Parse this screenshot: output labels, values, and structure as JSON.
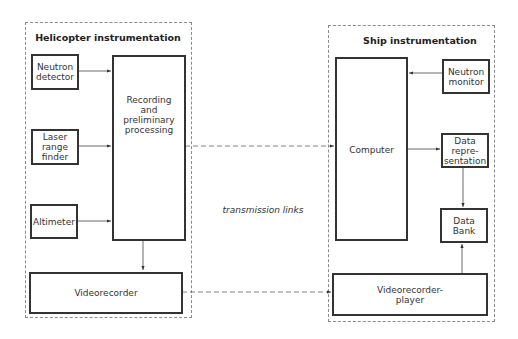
{
  "diagram": {
    "groups": [
      {
        "id": "helicopter",
        "title": "Helicopter instrumentation",
        "blocks": [
          {
            "id": "neutron-detector",
            "label": "Neutron\ndetector"
          },
          {
            "id": "laser-range-finder",
            "label": "Laser\nrange\nfinder"
          },
          {
            "id": "altimeter",
            "label": "Altimeter"
          },
          {
            "id": "recording",
            "label": "Recording\nand\npreliminary\nprocessing"
          },
          {
            "id": "videorecorder",
            "label": "Videorecorder"
          }
        ]
      },
      {
        "id": "ship",
        "title": "Ship instrumentation",
        "blocks": [
          {
            "id": "computer",
            "label": "Computer"
          },
          {
            "id": "neutron-monitor",
            "label": "Neutron\nmonitor"
          },
          {
            "id": "data-representation",
            "label": "Data\nrepre-\nsentation"
          },
          {
            "id": "data-bank",
            "label": "Data\nBank"
          },
          {
            "id": "videorecorder-player",
            "label": "Videorecorder-\nplayer"
          }
        ]
      }
    ],
    "caption": "transmission links",
    "connections": [
      {
        "from": "neutron-detector",
        "to": "recording",
        "style": "solid"
      },
      {
        "from": "laser-range-finder",
        "to": "recording",
        "style": "solid"
      },
      {
        "from": "altimeter",
        "to": "recording",
        "style": "solid"
      },
      {
        "from": "recording",
        "to": "videorecorder",
        "style": "solid"
      },
      {
        "from": "recording",
        "to": "computer",
        "style": "dashed",
        "label": "transmission links"
      },
      {
        "from": "videorecorder",
        "to": "videorecorder-player",
        "style": "dashed",
        "label": "transmission links"
      },
      {
        "from": "neutron-monitor",
        "to": "computer",
        "style": "solid"
      },
      {
        "from": "computer",
        "to": "data-representation",
        "style": "solid"
      },
      {
        "from": "data-representation",
        "to": "data-bank",
        "style": "solid"
      },
      {
        "from": "videorecorder-player",
        "to": "data-bank",
        "style": "solid"
      }
    ]
  }
}
